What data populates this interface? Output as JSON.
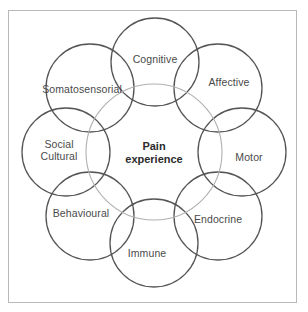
{
  "figure": {
    "frame_color": "#b9b9b9",
    "background": "#ffffff"
  },
  "center": {
    "name": "pain-experience",
    "line1": "Pain",
    "line2": "experience",
    "color": "#2b2b2b",
    "circle": {
      "cx": 154,
      "cy": 152,
      "r": 68,
      "stroke": "#b0b0b0"
    }
  },
  "nodes": [
    {
      "id": "cognitive",
      "label": "Cognitive",
      "label_line2": "",
      "cx": 155,
      "cy": 62,
      "r": 44,
      "label_x": 155,
      "label_y": 60,
      "stroke": "#555555"
    },
    {
      "id": "affective",
      "label": "Affective",
      "label_line2": "",
      "cx": 218,
      "cy": 88,
      "r": 44,
      "label_x": 229,
      "label_y": 83,
      "stroke": "#555555"
    },
    {
      "id": "motor",
      "label": "Motor",
      "label_line2": "",
      "cx": 242,
      "cy": 152,
      "r": 44,
      "label_x": 249,
      "label_y": 158,
      "stroke": "#555555"
    },
    {
      "id": "endocrine",
      "label": "Endocrine",
      "label_line2": "",
      "cx": 218,
      "cy": 216,
      "r": 44,
      "label_x": 218,
      "label_y": 220,
      "stroke": "#555555"
    },
    {
      "id": "immune",
      "label": "Immune",
      "label_line2": "",
      "cx": 154,
      "cy": 243,
      "r": 44,
      "label_x": 147,
      "label_y": 254,
      "stroke": "#555555"
    },
    {
      "id": "behavioural",
      "label": "Behavioural",
      "label_line2": "",
      "cx": 90,
      "cy": 216,
      "r": 44,
      "label_x": 81,
      "label_y": 214,
      "stroke": "#555555"
    },
    {
      "id": "social-cultural",
      "label": "Social",
      "label_line2": "Cultural",
      "cx": 66,
      "cy": 152,
      "r": 44,
      "label_x": 59,
      "label_y": 150,
      "stroke": "#555555"
    },
    {
      "id": "somatosensorial",
      "label": "Somatosensorial",
      "label_line2": "",
      "cx": 90,
      "cy": 88,
      "r": 44,
      "label_x": 82,
      "label_y": 90,
      "stroke": "#555555"
    }
  ]
}
